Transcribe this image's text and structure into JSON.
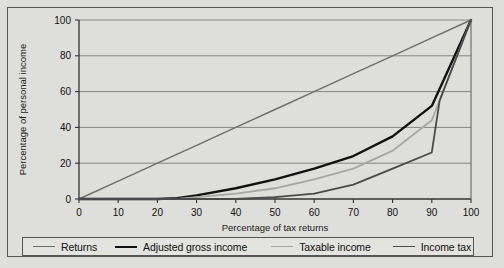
{
  "chart_data": {
    "type": "line",
    "title": "",
    "xlabel": "Percentage of tax returns",
    "ylabel": "Percentage of personal income",
    "xlim": [
      0,
      100
    ],
    "ylim": [
      0,
      100
    ],
    "xticks": [
      0,
      10,
      20,
      30,
      40,
      50,
      60,
      70,
      80,
      90,
      100
    ],
    "yticks": [
      0,
      20,
      40,
      60,
      80,
      100
    ],
    "grid": "horizontal",
    "legend_position": "bottom",
    "series": [
      {
        "name": "Returns",
        "color": "#6e6e6e",
        "width": 1.4,
        "x": [
          0,
          10,
          20,
          30,
          40,
          50,
          60,
          70,
          80,
          90,
          100
        ],
        "values": [
          0,
          10,
          20,
          30,
          40,
          50,
          60,
          70,
          80,
          90,
          100
        ]
      },
      {
        "name": "Adjusted gross income",
        "color": "#111111",
        "width": 2.4,
        "x": [
          0,
          10,
          20,
          25,
          30,
          40,
          50,
          60,
          70,
          80,
          90,
          100
        ],
        "values": [
          0,
          0,
          0,
          0.5,
          2,
          6,
          11,
          17,
          24,
          35,
          52,
          100
        ]
      },
      {
        "name": "Taxable income",
        "color": "#a6a6a6",
        "width": 1.8,
        "x": [
          0,
          10,
          20,
          25,
          30,
          40,
          50,
          60,
          70,
          80,
          90,
          100
        ],
        "values": [
          0,
          0,
          0,
          0,
          1,
          3,
          6,
          11,
          17,
          27,
          44,
          100
        ]
      },
      {
        "name": "Income tax",
        "color": "#4a4a4a",
        "width": 1.8,
        "x": [
          0,
          10,
          20,
          30,
          40,
          50,
          60,
          70,
          80,
          90,
          92,
          100
        ],
        "values": [
          0,
          0,
          0,
          0,
          0,
          1,
          3,
          8,
          17,
          26,
          55,
          100
        ]
      }
    ]
  },
  "legend": {
    "items": [
      {
        "label": "Returns",
        "color": "#6e6e6e",
        "width": 1.4
      },
      {
        "label": "Adjusted gross income",
        "color": "#111111",
        "width": 2.4
      },
      {
        "label": "Taxable income",
        "color": "#a6a6a6",
        "width": 1.8
      },
      {
        "label": "Income tax",
        "color": "#4a4a4a",
        "width": 1.8
      }
    ]
  },
  "axes": {
    "y_title": "Percentage of personal income",
    "x_title": "Percentage of tax returns"
  }
}
